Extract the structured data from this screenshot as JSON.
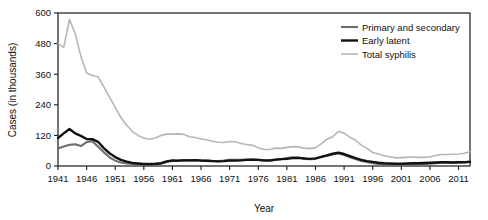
{
  "chart_data": {
    "type": "line",
    "title": "",
    "xlabel": "Year",
    "ylabel": "Cases (in thousands)",
    "xlim": [
      1941,
      2013
    ],
    "ylim": [
      0,
      600
    ],
    "yticks": [
      0,
      120,
      240,
      360,
      480,
      600
    ],
    "xticks": [
      1941,
      1946,
      1951,
      1956,
      1961,
      1966,
      1971,
      1976,
      1981,
      1986,
      1991,
      1996,
      2001,
      2006,
      2011
    ],
    "grid": false,
    "legend_position": "top-right",
    "x": [
      1941,
      1942,
      1943,
      1944,
      1945,
      1946,
      1947,
      1948,
      1949,
      1950,
      1951,
      1952,
      1953,
      1954,
      1955,
      1956,
      1957,
      1958,
      1959,
      1960,
      1961,
      1962,
      1963,
      1964,
      1965,
      1966,
      1967,
      1968,
      1969,
      1970,
      1971,
      1972,
      1973,
      1974,
      1975,
      1976,
      1977,
      1978,
      1979,
      1980,
      1981,
      1982,
      1983,
      1984,
      1985,
      1986,
      1987,
      1988,
      1989,
      1990,
      1991,
      1992,
      1993,
      1994,
      1995,
      1996,
      1997,
      1998,
      1999,
      2000,
      2001,
      2002,
      2003,
      2004,
      2005,
      2006,
      2007,
      2008,
      2009,
      2010,
      2011,
      2012,
      2013
    ],
    "series": [
      {
        "name": "Primary and secondary",
        "color": "#6e6e6e",
        "width": 2.1,
        "values": [
          69,
          76,
          83,
          85,
          78,
          94,
          97,
          76,
          54,
          34,
          21,
          14,
          10,
          8,
          7,
          6,
          6,
          7,
          9,
          16,
          20,
          21,
          23,
          22,
          23,
          22,
          22,
          20,
          19,
          21,
          24,
          24,
          24,
          25,
          25,
          24,
          21,
          21,
          24,
          27,
          31,
          34,
          33,
          28,
          27,
          28,
          35,
          40,
          45,
          50,
          43,
          34,
          27,
          20,
          16,
          11,
          8,
          7,
          6,
          6,
          6,
          7,
          7,
          8,
          8,
          9,
          11,
          13,
          14,
          13,
          14,
          15,
          17
        ]
      },
      {
        "name": "Early latent",
        "color": "#111111",
        "width": 2.4,
        "values": [
          110,
          128,
          145,
          128,
          118,
          106,
          105,
          95,
          70,
          50,
          35,
          24,
          17,
          12,
          10,
          8,
          8,
          9,
          11,
          18,
          22,
          21,
          22,
          22,
          23,
          21,
          20,
          19,
          18,
          19,
          21,
          21,
          22,
          24,
          25,
          24,
          22,
          22,
          25,
          27,
          28,
          31,
          32,
          30,
          28,
          30,
          36,
          42,
          48,
          52,
          47,
          39,
          31,
          24,
          19,
          16,
          13,
          11,
          10,
          9,
          9,
          10,
          11,
          11,
          12,
          13,
          14,
          15,
          15,
          14,
          15,
          15,
          16
        ]
      },
      {
        "name": "Total syphilis",
        "color": "#b6b6b6",
        "width": 1.6,
        "values": [
          480,
          465,
          575,
          520,
          430,
          365,
          355,
          350,
          310,
          270,
          230,
          190,
          160,
          135,
          120,
          110,
          105,
          110,
          120,
          125,
          125,
          126,
          124,
          115,
          112,
          106,
          103,
          97,
          93,
          92,
          96,
          95,
          88,
          84,
          81,
          72,
          65,
          65,
          70,
          69,
          73,
          76,
          75,
          70,
          68,
          72,
          87,
          105,
          115,
          135,
          129,
          113,
          101,
          82,
          69,
          53,
          47,
          40,
          36,
          32,
          33,
          34,
          35,
          34,
          34,
          36,
          41,
          45,
          45,
          46,
          47,
          50,
          56
        ]
      }
    ]
  }
}
